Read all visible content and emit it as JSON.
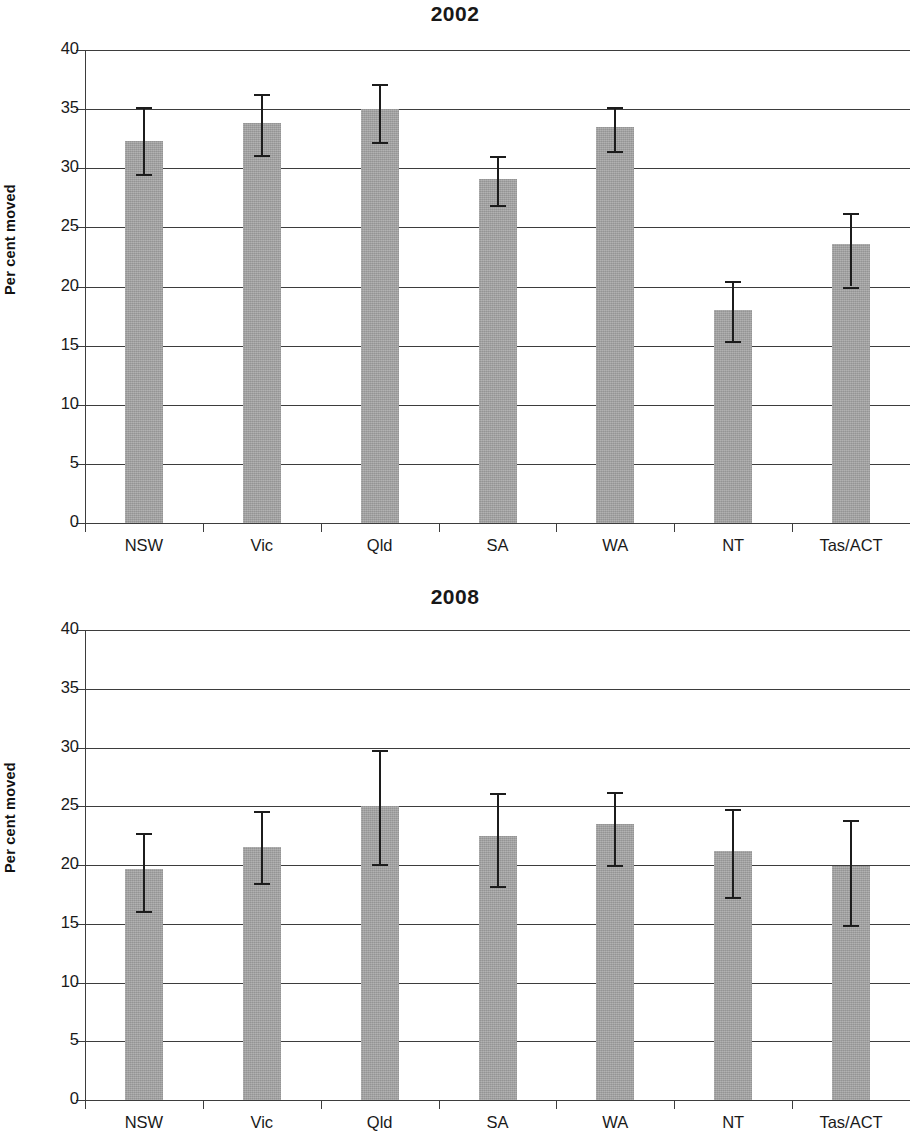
{
  "figure": {
    "panels": [
      {
        "title": "2002",
        "ylabel": "Per cent moved",
        "y_ticks": [
          "0",
          "5",
          "10",
          "15",
          "20",
          "25",
          "30",
          "35",
          "40"
        ],
        "x_labels": [
          "NSW",
          "Vic",
          "Qld",
          "SA",
          "WA",
          "NT",
          "Tas/ACT"
        ]
      },
      {
        "title": "2008",
        "ylabel": "Per cent moved",
        "y_ticks": [
          "0",
          "5",
          "10",
          "15",
          "20",
          "25",
          "30",
          "35",
          "40"
        ],
        "x_labels": [
          "NSW",
          "Vic",
          "Qld",
          "SA",
          "WA",
          "NT",
          "Tas/ACT"
        ]
      }
    ],
    "colors": {
      "bar_fill": "#a2a2a2",
      "axis": "#3d3d3d",
      "error_bar": "#1c1c1c",
      "text": "#1a1a1a",
      "background": "#ffffff"
    }
  },
  "chart_data": [
    {
      "type": "bar",
      "title": "2002",
      "xlabel": "",
      "ylabel": "Per cent moved",
      "ylim": [
        0,
        40
      ],
      "yticks": [
        0,
        5,
        10,
        15,
        20,
        25,
        30,
        35,
        40
      ],
      "grid": true,
      "legend": null,
      "categories": [
        "NSW",
        "Vic",
        "Qld",
        "SA",
        "WA",
        "NT",
        "Tas/ACT"
      ],
      "values": [
        32.3,
        33.8,
        35.0,
        29.1,
        33.5,
        18.0,
        23.6
      ],
      "error_low": [
        29.5,
        31.1,
        32.2,
        26.9,
        31.5,
        15.4,
        20.0
      ],
      "error_high": [
        35.2,
        36.3,
        37.1,
        31.0,
        35.2,
        20.5,
        26.2
      ]
    },
    {
      "type": "bar",
      "title": "2008",
      "xlabel": "",
      "ylabel": "Per cent moved",
      "ylim": [
        0,
        40
      ],
      "yticks": [
        0,
        5,
        10,
        15,
        20,
        25,
        30,
        35,
        40
      ],
      "grid": true,
      "legend": null,
      "categories": [
        "NSW",
        "Vic",
        "Qld",
        "SA",
        "WA",
        "NT",
        "Tas/ACT"
      ],
      "values": [
        19.7,
        21.5,
        25.0,
        22.5,
        23.5,
        21.2,
        19.9
      ],
      "error_low": [
        16.1,
        18.5,
        20.1,
        18.2,
        20.0,
        17.3,
        14.9
      ],
      "error_high": [
        22.7,
        24.6,
        29.8,
        26.1,
        26.2,
        24.8,
        23.8
      ]
    }
  ]
}
